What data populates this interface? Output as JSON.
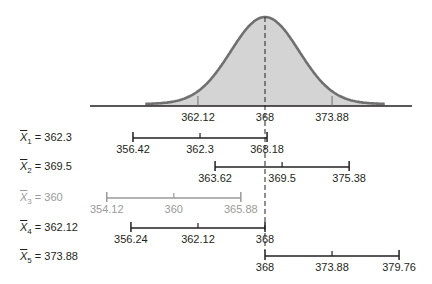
{
  "chart_data": {
    "type": "diagram",
    "title": "",
    "population_mean": 368,
    "distribution": {
      "shape": "normal",
      "axis_ticks": [
        362.12,
        368,
        373.88
      ],
      "axis_tick_labels": [
        "362.12",
        "368",
        "373.88"
      ],
      "fill_color": "#d4d4d4",
      "stroke_color": "#707070"
    },
    "intervals": [
      {
        "name": "X̄1",
        "label_prefix": "X",
        "subscript": "1",
        "value_text": " = 362.3",
        "mean": 362.3,
        "lower": 356.42,
        "upper": 368.18,
        "tick_labels": [
          "356.42",
          "362.3",
          "368.18"
        ],
        "contains_mu": true,
        "color": "#231f20"
      },
      {
        "name": "X̄2",
        "label_prefix": "X",
        "subscript": "2",
        "value_text": " = 369.5",
        "mean": 369.5,
        "lower": 363.62,
        "upper": 375.38,
        "tick_labels": [
          "363.62",
          "369.5",
          "375.38"
        ],
        "contains_mu": true,
        "color": "#231f20"
      },
      {
        "name": "X̄3",
        "label_prefix": "X",
        "subscript": "3",
        "value_text": " = 360",
        "mean": 360,
        "lower": 354.12,
        "upper": 365.88,
        "tick_labels": [
          "354.12",
          "360",
          "365.88"
        ],
        "contains_mu": false,
        "color": "#9a9a9a"
      },
      {
        "name": "X̄4",
        "label_prefix": "X",
        "subscript": "4",
        "value_text": " = 362.12",
        "mean": 362.12,
        "lower": 356.24,
        "upper": 368,
        "tick_labels": [
          "356.24",
          "362.12",
          "368"
        ],
        "contains_mu": true,
        "color": "#231f20"
      },
      {
        "name": "X̄5",
        "label_prefix": "X",
        "subscript": "5",
        "value_text": " = 373.88",
        "mean": 373.88,
        "lower": 368,
        "upper": 379.76,
        "tick_labels": [
          "368",
          "373.88",
          "379.76"
        ],
        "contains_mu": true,
        "color": "#231f20"
      }
    ]
  }
}
